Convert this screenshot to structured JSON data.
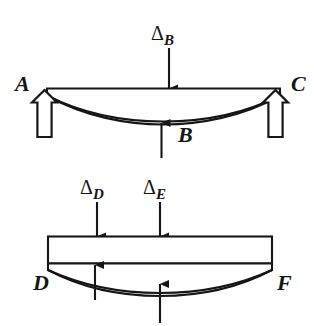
{
  "figure": {
    "background_color": "#ffffff",
    "line_color": "#161616",
    "fill_color": "#ffffff",
    "upper_diagram": {
      "name": "simply-supported-beam-ABC",
      "node_labels": {
        "left": "A",
        "center": "B",
        "right": "C"
      },
      "load_label": {
        "symbol": "Δ",
        "subscript": "B"
      },
      "supports": [
        {
          "name": "left-support-reaction",
          "direction": "up",
          "style": "hollow-block-arrow"
        },
        {
          "name": "right-support-reaction",
          "direction": "up",
          "style": "hollow-block-arrow"
        }
      ],
      "center_reaction": {
        "name": "center-reaction-B",
        "direction": "up",
        "style": "solid-line-arrow"
      },
      "applied_load": {
        "name": "applied-load-delta-B",
        "direction": "down",
        "style": "solid-line-arrow"
      }
    },
    "lower_diagram": {
      "name": "beam-with-rigid-block-DF",
      "node_labels": {
        "left": "D",
        "right": "F"
      },
      "load_labels": [
        {
          "symbol": "Δ",
          "subscript": "D"
        },
        {
          "symbol": "Δ",
          "subscript": "E"
        }
      ],
      "applied_loads": [
        {
          "name": "applied-load-delta-D",
          "direction": "down",
          "style": "solid-line-arrow"
        },
        {
          "name": "applied-load-delta-E",
          "direction": "down",
          "style": "solid-line-arrow"
        }
      ],
      "reactions": [
        {
          "name": "reaction-left-inner",
          "direction": "up",
          "style": "solid-line-arrow"
        },
        {
          "name": "reaction-center",
          "direction": "up",
          "style": "solid-line-arrow"
        }
      ]
    }
  }
}
